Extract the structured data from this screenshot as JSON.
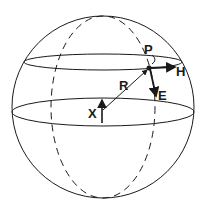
{
  "diagram": {
    "type": "sphere-coordinate-diagram",
    "labels": {
      "P": "P",
      "H": "H",
      "E": "E",
      "R": "R",
      "X": "X"
    },
    "colors": {
      "stroke": "#1a1a1a",
      "background": "#ffffff"
    }
  }
}
